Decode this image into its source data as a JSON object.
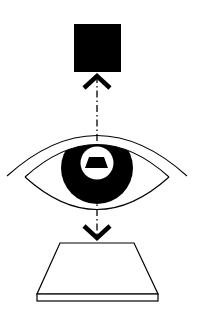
{
  "diagram": {
    "colors": {
      "background": "#ffffff",
      "ink": "#000000"
    },
    "elements": [
      {
        "id": "top-square",
        "shape": "filled-square",
        "label": ""
      },
      {
        "id": "up-arrow",
        "shape": "chevron-arrow",
        "direction": "up"
      },
      {
        "id": "eye",
        "shape": "eye-outline",
        "parts": [
          "brow-arc",
          "upper-lid",
          "lower-lid",
          "iris",
          "pupil",
          "pupil-trapezoid"
        ]
      },
      {
        "id": "down-arrow",
        "shape": "chevron-arrow",
        "direction": "down"
      },
      {
        "id": "bottom-slab",
        "shape": "trapezoid-slab"
      },
      {
        "id": "axis-line",
        "shape": "dash-dot-line",
        "orientation": "vertical"
      }
    ]
  }
}
